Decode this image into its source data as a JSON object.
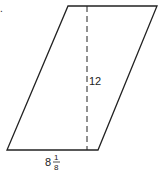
{
  "figure": {
    "problem_marker": ".",
    "shape": "parallelogram",
    "height_label": "12",
    "base_label": {
      "whole": "8",
      "numerator": "1",
      "denominator": "8"
    },
    "colors": {
      "stroke": "#222222",
      "background": "#ffffff"
    }
  }
}
